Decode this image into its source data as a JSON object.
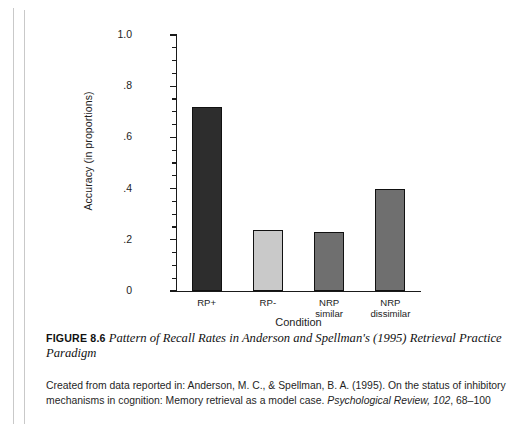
{
  "figure": {
    "label": "FIGURE 8.6",
    "title": "Pattern of Recall Rates in Anderson and Spellman's (1995) Retrieval Practice Paradigm",
    "source_prefix": "Created from data reported in: Anderson, M. C., & Spellman, B. A. (1995). On the status of inhibitory mechanisms in cognition: Memory retrieval as a model case. ",
    "source_journal": "Psychological Review, 102",
    "source_pages": ", 68–100"
  },
  "chart_data": {
    "type": "bar",
    "title": "",
    "categories": [
      "RP+",
      "RP-",
      "NRP\nsimilar",
      "NRP\ndissimilar"
    ],
    "values": [
      0.72,
      0.24,
      0.23,
      0.4
    ],
    "xlabel": "Condition",
    "ylabel": "Accuracy (in proportions)",
    "ylim": [
      0,
      1.0
    ],
    "ytick_labels": [
      "0",
      ".2",
      ".4",
      ".6",
      ".8",
      "1.0"
    ],
    "ytick_values": [
      0,
      0.2,
      0.4,
      0.6,
      0.8,
      1.0
    ],
    "minor_tick_step": 0.05,
    "grid": false,
    "legend": "none",
    "bar_colors": [
      "#2d2d2d",
      "#c9c9c9",
      "#6f6f6f",
      "#6f6f6f"
    ],
    "bar_edge_color": "#111111",
    "axis_color": "#1a1a1a"
  }
}
